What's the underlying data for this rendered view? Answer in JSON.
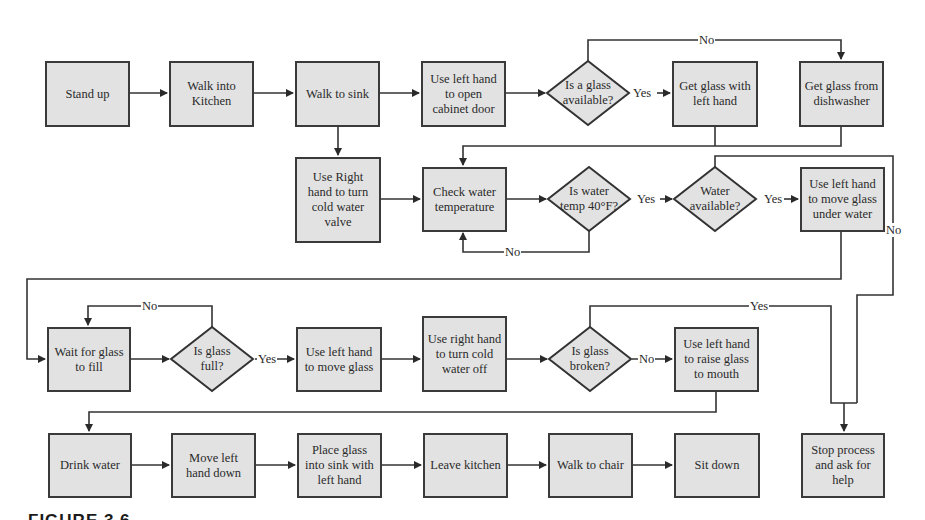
{
  "diagram": {
    "type": "flowchart",
    "colors": {
      "box_fill": "#e2e2e2",
      "stroke": "#3a3a3a",
      "background": "#ffffff"
    },
    "nodes": {
      "stand_up": "Stand up",
      "walk_kitchen": "Walk into Kitchen",
      "walk_sink": "Walk to sink",
      "open_cabinet": "Use left hand to open cabinet door",
      "glass_available": "Is a glass available?",
      "get_glass_left": "Get glass with left hand",
      "get_glass_dishwasher": "Get glass from dishwasher",
      "turn_valve": "Use Right hand to turn cold water valve",
      "check_temp": "Check water temperature",
      "temp_40": "Is water temp 40°F?",
      "water_available": "Water available?",
      "move_under_water": "Use left hand to move glass under water",
      "wait_fill": "Wait for glass to fill",
      "glass_full": "Is glass full?",
      "move_glass": "Use left hand to move glass",
      "turn_off": "Use right hand to turn cold water off",
      "glass_broken": "Is glass broken?",
      "raise_glass": "Use left hand to raise glass to mouth",
      "drink": "Drink water",
      "hand_down": "Move left hand down",
      "place_sink": "Place glass into sink with left hand",
      "leave_kitchen": "Leave kitchen",
      "walk_chair": "Walk to chair",
      "sit_down": "Sit down",
      "stop_help": "Stop process and ask for help"
    },
    "edge_labels": {
      "glass_no": "No",
      "glass_yes": "Yes",
      "temp_yes": "Yes",
      "temp_no": "No",
      "water_yes": "Yes",
      "water_no": "No",
      "full_no": "No",
      "full_yes": "Yes",
      "broken_no": "No",
      "broken_yes": "Yes"
    },
    "caption": "FIGURE 3.6"
  }
}
